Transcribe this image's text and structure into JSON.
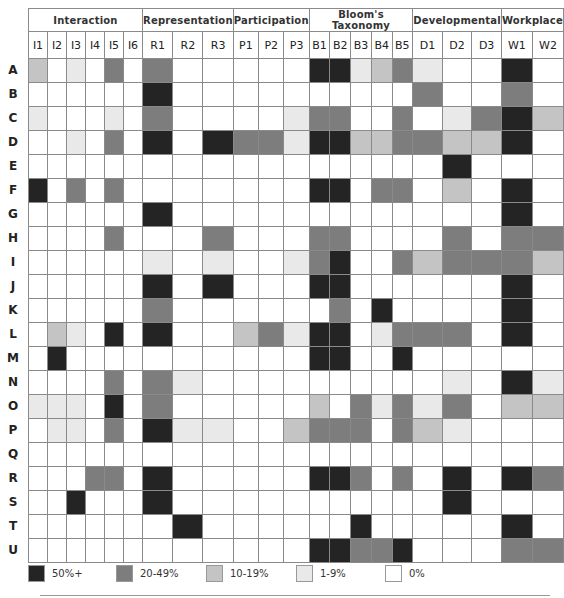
{
  "chart_data": {
    "type": "heatmap",
    "title": "",
    "groups": [
      {
        "name": "Interaction",
        "columns": [
          "I1",
          "I2",
          "I3",
          "I4",
          "I5",
          "I6"
        ]
      },
      {
        "name": "Representation",
        "columns": [
          "R1",
          "R2",
          "R3"
        ]
      },
      {
        "name": "Participation",
        "columns": [
          "P1",
          "P2",
          "P3"
        ]
      },
      {
        "name": "Bloom's Taxonomy",
        "columns": [
          "B1",
          "B2",
          "B3",
          "B4",
          "B5"
        ]
      },
      {
        "name": "Developmental",
        "columns": [
          "D1",
          "D2",
          "D3"
        ]
      },
      {
        "name": "Workplace",
        "columns": [
          "W1",
          "W2"
        ]
      }
    ],
    "columns": [
      "I1",
      "I2",
      "I3",
      "I4",
      "I5",
      "I6",
      "R1",
      "R2",
      "R3",
      "P1",
      "P2",
      "P3",
      "B1",
      "B2",
      "B3",
      "B4",
      "B5",
      "D1",
      "D2",
      "D3",
      "W1",
      "W2"
    ],
    "rows": [
      "A",
      "B",
      "C",
      "D",
      "E",
      "F",
      "G",
      "H",
      "I",
      "J",
      "K",
      "L",
      "M",
      "N",
      "O",
      "P",
      "Q",
      "R",
      "S",
      "T",
      "U"
    ],
    "level_scale": {
      "0": "0%",
      "1": "1-9%",
      "2": "10-19%",
      "3": "20-49%",
      "4": "50%+"
    },
    "values": [
      [
        2,
        0,
        1,
        0,
        3,
        0,
        3,
        0,
        0,
        0,
        0,
        0,
        4,
        4,
        1,
        2,
        3,
        1,
        0,
        0,
        4,
        0
      ],
      [
        0,
        0,
        0,
        0,
        0,
        0,
        4,
        0,
        0,
        0,
        0,
        0,
        0,
        0,
        0,
        0,
        0,
        3,
        0,
        0,
        3,
        0
      ],
      [
        1,
        0,
        0,
        0,
        1,
        0,
        3,
        0,
        0,
        0,
        0,
        1,
        3,
        3,
        0,
        0,
        3,
        0,
        1,
        3,
        4,
        2
      ],
      [
        0,
        0,
        1,
        0,
        3,
        0,
        4,
        0,
        4,
        3,
        3,
        1,
        4,
        4,
        2,
        2,
        3,
        3,
        2,
        2,
        4,
        0
      ],
      [
        0,
        0,
        0,
        0,
        0,
        0,
        0,
        0,
        0,
        0,
        0,
        0,
        0,
        0,
        0,
        0,
        0,
        0,
        4,
        0,
        0,
        0
      ],
      [
        4,
        0,
        3,
        0,
        3,
        0,
        0,
        0,
        0,
        0,
        0,
        0,
        4,
        4,
        0,
        3,
        3,
        0,
        2,
        0,
        4,
        0
      ],
      [
        0,
        0,
        0,
        0,
        0,
        0,
        4,
        0,
        0,
        0,
        0,
        0,
        0,
        0,
        0,
        0,
        0,
        0,
        0,
        0,
        4,
        0
      ],
      [
        0,
        0,
        0,
        0,
        3,
        0,
        0,
        0,
        3,
        0,
        0,
        0,
        3,
        3,
        0,
        0,
        0,
        0,
        3,
        0,
        3,
        3
      ],
      [
        0,
        0,
        0,
        0,
        0,
        0,
        1,
        0,
        1,
        0,
        0,
        1,
        3,
        4,
        0,
        0,
        3,
        2,
        3,
        3,
        3,
        2
      ],
      [
        0,
        0,
        0,
        0,
        0,
        0,
        4,
        0,
        4,
        0,
        0,
        0,
        4,
        4,
        0,
        0,
        0,
        0,
        0,
        0,
        4,
        0
      ],
      [
        0,
        0,
        0,
        0,
        0,
        0,
        3,
        0,
        0,
        0,
        0,
        0,
        0,
        3,
        0,
        4,
        0,
        0,
        0,
        0,
        4,
        0
      ],
      [
        0,
        2,
        1,
        0,
        4,
        0,
        4,
        0,
        0,
        2,
        3,
        1,
        4,
        4,
        0,
        1,
        3,
        3,
        3,
        0,
        4,
        0
      ],
      [
        0,
        4,
        0,
        0,
        0,
        0,
        0,
        0,
        0,
        0,
        0,
        0,
        4,
        4,
        0,
        0,
        4,
        0,
        0,
        0,
        0,
        0
      ],
      [
        0,
        0,
        0,
        0,
        3,
        0,
        3,
        1,
        0,
        0,
        0,
        0,
        0,
        0,
        0,
        0,
        0,
        0,
        1,
        0,
        4,
        1
      ],
      [
        1,
        1,
        1,
        0,
        4,
        0,
        3,
        0,
        0,
        0,
        0,
        0,
        2,
        0,
        3,
        1,
        3,
        1,
        3,
        0,
        2,
        2
      ],
      [
        0,
        1,
        1,
        0,
        3,
        0,
        4,
        1,
        1,
        0,
        0,
        2,
        3,
        3,
        3,
        0,
        3,
        2,
        1,
        0,
        0,
        0
      ],
      [
        0,
        0,
        0,
        0,
        0,
        0,
        0,
        0,
        0,
        0,
        0,
        0,
        0,
        0,
        0,
        0,
        0,
        0,
        0,
        0,
        0,
        0
      ],
      [
        0,
        0,
        0,
        3,
        3,
        0,
        4,
        0,
        0,
        0,
        0,
        0,
        4,
        4,
        3,
        0,
        3,
        0,
        4,
        0,
        4,
        3
      ],
      [
        0,
        0,
        4,
        0,
        0,
        0,
        4,
        0,
        0,
        0,
        0,
        0,
        0,
        0,
        0,
        0,
        0,
        0,
        4,
        0,
        0,
        0
      ],
      [
        0,
        0,
        0,
        0,
        0,
        0,
        0,
        4,
        0,
        0,
        0,
        0,
        0,
        0,
        4,
        0,
        0,
        0,
        0,
        0,
        4,
        0
      ],
      [
        0,
        0,
        0,
        0,
        0,
        0,
        0,
        0,
        0,
        0,
        0,
        0,
        4,
        4,
        3,
        3,
        4,
        0,
        0,
        0,
        3,
        3
      ]
    ],
    "legend": [
      {
        "level": 4,
        "label": "50%+",
        "color": "#242424"
      },
      {
        "level": 3,
        "label": "20-49%",
        "color": "#7d7d7d"
      },
      {
        "level": 2,
        "label": "10-19%",
        "color": "#c4c4c4"
      },
      {
        "level": 1,
        "label": "1-9%",
        "color": "#e9e9e9"
      },
      {
        "level": 0,
        "label": "0%",
        "color": "#ffffff"
      }
    ],
    "legend_position": "bottom",
    "grid": true
  }
}
